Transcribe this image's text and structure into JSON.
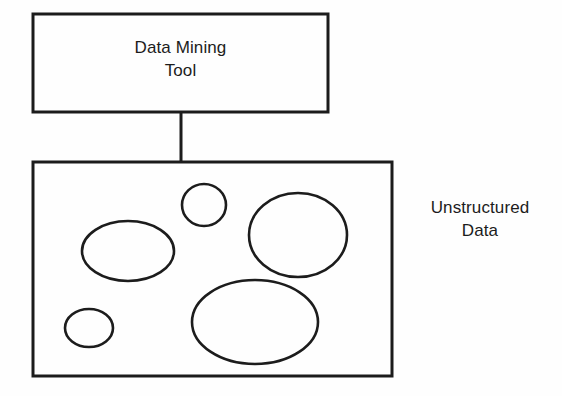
{
  "diagram": {
    "type": "block-diagram",
    "background_color": "#fefefe",
    "stroke_color": "#1c1c1c",
    "text_color": "#1c1c1c",
    "nodes": {
      "tool_box": {
        "label": "Data Mining\nTool",
        "shape": "rectangle",
        "x": 33,
        "y": 14,
        "width": 295,
        "height": 98,
        "stroke_width": 3
      },
      "data_box": {
        "label": "Unstructured\nData",
        "label_position": "right-outside",
        "shape": "rectangle",
        "x": 33,
        "y": 162,
        "width": 359,
        "height": 214,
        "stroke_width": 3
      }
    },
    "connector": {
      "name": "tool-to-data-connector",
      "from": "tool_box",
      "to": "data_box",
      "x": 181,
      "y1": 112,
      "y2": 162,
      "stroke_width": 3
    },
    "blobs": [
      {
        "name": "blob-top-small-circle",
        "cx": 204,
        "cy": 205,
        "rx": 22,
        "ry": 21,
        "stroke_width": 2.6
      },
      {
        "name": "blob-left-ellipse",
        "cx": 128,
        "cy": 251,
        "rx": 46,
        "ry": 30,
        "stroke_width": 2.6
      },
      {
        "name": "blob-right-large-circle",
        "cx": 298,
        "cy": 235,
        "rx": 49,
        "ry": 42,
        "stroke_width": 2.6
      },
      {
        "name": "blob-bottom-large-ellipse",
        "cx": 255,
        "cy": 322,
        "rx": 63,
        "ry": 42,
        "stroke_width": 2.6
      },
      {
        "name": "blob-bottom-left-small",
        "cx": 89,
        "cy": 328,
        "rx": 24,
        "ry": 19,
        "stroke_width": 2.6
      }
    ]
  }
}
